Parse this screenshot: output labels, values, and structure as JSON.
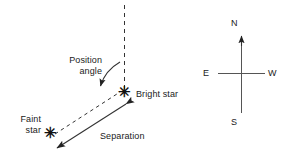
{
  "diagram": {
    "line_color": "#333333",
    "text_color": "#1a1a1a",
    "background": "#ffffff",
    "labels": {
      "position_angle_line1": "Position",
      "position_angle_line2": "angle",
      "bright_star": "Bright star",
      "faint_star_line1": "Faint",
      "faint_star_line2": "star",
      "separation": "Separation"
    },
    "star_glyph": "✳",
    "compass": {
      "north": "N",
      "east": "E",
      "west": "W",
      "south": "S"
    }
  }
}
